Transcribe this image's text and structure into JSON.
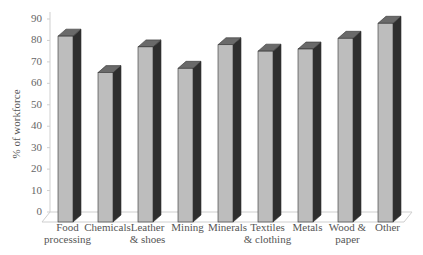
{
  "chart_data": {
    "type": "bar",
    "style": "3d-column",
    "title": "",
    "xlabel": "",
    "ylabel": "% of workforce",
    "ylim": [
      0,
      90
    ],
    "yticks": [
      0,
      10,
      20,
      30,
      40,
      50,
      60,
      70,
      80,
      90
    ],
    "grid": false,
    "legend": null,
    "categories": [
      "Food processing",
      "Chemicals",
      "Leather & shoes",
      "Mining",
      "Minerals",
      "Textiles & clothing",
      "Metals",
      "Wood & paper",
      "Other"
    ],
    "category_lines": [
      [
        "Food",
        "processing"
      ],
      [
        "Chemicals",
        ""
      ],
      [
        "Leather",
        "& shoes"
      ],
      [
        "Mining",
        ""
      ],
      [
        "Minerals",
        ""
      ],
      [
        "Textiles",
        "& clothing"
      ],
      [
        "Metals",
        ""
      ],
      [
        "Wood &",
        "paper"
      ],
      [
        "Other",
        ""
      ]
    ],
    "values": [
      82,
      65,
      77,
      67,
      78,
      75,
      76,
      81,
      88
    ],
    "colors": {
      "front": "#bdbdbd",
      "side": "#2e2e2e",
      "top": "#6a6a6a",
      "outline": "#333333",
      "axis": "#cfcfcf"
    }
  }
}
